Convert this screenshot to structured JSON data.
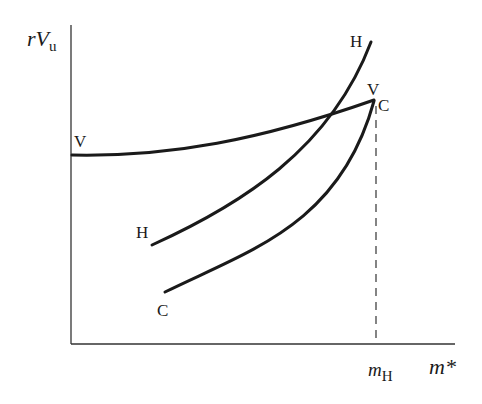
{
  "figure": {
    "y_axis_label": {
      "main": "rV",
      "sub": "u"
    },
    "x_axis_label": "m*",
    "x_marker_label": {
      "main": "m",
      "sub": "H"
    },
    "curves": [
      {
        "id": "V",
        "start_label": "V",
        "end_label": "V"
      },
      {
        "id": "H",
        "start_label": "H",
        "end_label": "H"
      },
      {
        "id": "C",
        "start_label": "C",
        "end_label": "C"
      }
    ],
    "colors": {
      "ink": "#1a1a1a",
      "axis": "#333333",
      "background": "#ffffff"
    }
  }
}
